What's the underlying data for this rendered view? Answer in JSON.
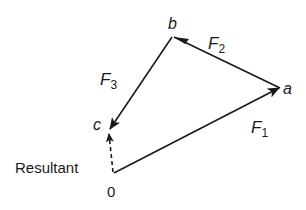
{
  "diagram": {
    "type": "vector-polygon",
    "points": {
      "origin": {
        "label": "0",
        "x": 113,
        "y": 173
      },
      "a": {
        "label": "a",
        "x": 279,
        "y": 88
      },
      "b": {
        "label": "b",
        "x": 173,
        "y": 37
      },
      "c": {
        "label": "c",
        "x": 109,
        "y": 130
      }
    },
    "vectors": [
      {
        "name": "F",
        "sub": "1",
        "from": "origin",
        "to": "a",
        "style": "solid"
      },
      {
        "name": "F",
        "sub": "2",
        "from": "a",
        "to": "b",
        "style": "solid"
      },
      {
        "name": "F",
        "sub": "3",
        "from": "b",
        "to": "c",
        "style": "solid"
      },
      {
        "name": "Resultant",
        "from": "origin",
        "to": "c",
        "style": "dashed"
      }
    ],
    "labels": {
      "origin": "0",
      "a": "a",
      "b": "b",
      "c": "c",
      "resultant": "Resultant",
      "f1_main": "F",
      "f1_sub": "1",
      "f2_main": "F",
      "f2_sub": "2",
      "f3_main": "F",
      "f3_sub": "3"
    },
    "colors": {
      "stroke": "#1a1a1a",
      "background": "#ffffff"
    }
  }
}
